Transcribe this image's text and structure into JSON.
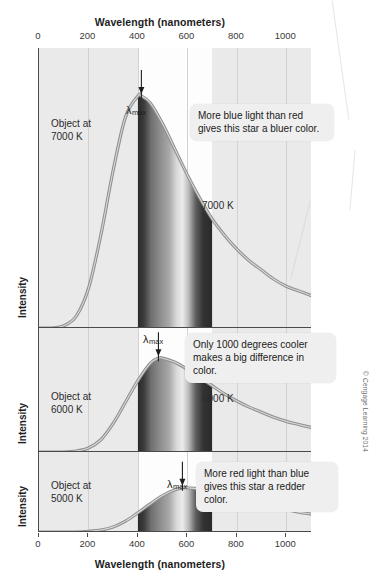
{
  "figure": {
    "top_axis_title": "Wavelength (nanometers)",
    "bottom_axis_title": "Wavelength (nanometers)",
    "y_axis_label": "Intensity",
    "copyright": "© Cengage Learning 2014"
  },
  "ticks": {
    "labels": [
      "0",
      "200",
      "400",
      "600",
      "800",
      "1000"
    ],
    "values": [
      0,
      200,
      400,
      600,
      800,
      1000
    ]
  },
  "bands": [
    {
      "name": "Ultraviolet",
      "start_nm": 0,
      "end_nm": 400
    },
    {
      "name": "Visual",
      "start_nm": 400,
      "end_nm": 700
    },
    {
      "name": "Infrared",
      "start_nm": 700,
      "end_nm": 1100
    }
  ],
  "panels": [
    {
      "object_label": "Object at\n7000 K",
      "temp_label": "7000 K",
      "lmax_label": "λ",
      "lmax_sub": "max",
      "callout": "More blue light than red\ngives this star a bluer color.",
      "peak_nm": 414,
      "temperature_k": 7000
    },
    {
      "object_label": "Object at\n6000 K",
      "temp_label": "6000 K",
      "lmax_label": "λ",
      "lmax_sub": "max",
      "callout": "Only 1000 degrees cooler\nmakes a big difference in color.",
      "peak_nm": 483,
      "temperature_k": 6000
    },
    {
      "object_label": "Object at\n5000 K",
      "temp_label": "5000 K",
      "lmax_label": "λ",
      "lmax_sub": "max",
      "callout": "More red light than blue\ngives this star a redder color.",
      "peak_nm": 580,
      "temperature_k": 5000
    }
  ],
  "chart_data": {
    "type": "line",
    "xlabel": "Wavelength (nanometers)",
    "ylabel": "Intensity",
    "xlim": [
      0,
      1100
    ],
    "xticks": [
      0,
      200,
      400,
      600,
      800,
      1000
    ],
    "grid": true,
    "legend_position": "in-plot",
    "annotations": [
      "Ultraviolet",
      "Visual",
      "Infrared",
      "More blue light than red gives this star a bluer color.",
      "Only 1000 degrees cooler makes a big difference in color.",
      "More red light than blue gives this star a redder color."
    ],
    "series": [
      {
        "name": "7000 K",
        "peak_nm": 414,
        "panel": 1,
        "x": [
          0,
          50,
          100,
          150,
          200,
          250,
          300,
          350,
          400,
          414,
          450,
          500,
          550,
          600,
          650,
          700,
          750,
          800,
          850,
          900,
          950,
          1000,
          1050,
          1100
        ],
        "y": [
          0.0,
          0.0,
          0.01,
          0.05,
          0.17,
          0.4,
          0.68,
          0.91,
          1.0,
          1.0,
          0.97,
          0.88,
          0.77,
          0.66,
          0.56,
          0.47,
          0.4,
          0.34,
          0.29,
          0.25,
          0.21,
          0.18,
          0.16,
          0.14
        ]
      },
      {
        "name": "6000 K",
        "peak_nm": 483,
        "panel": 2,
        "x": [
          0,
          50,
          100,
          150,
          200,
          250,
          300,
          350,
          400,
          450,
          483,
          500,
          550,
          600,
          650,
          700,
          750,
          800,
          850,
          900,
          950,
          1000,
          1050,
          1100
        ],
        "y": [
          0.0,
          0.0,
          0.0,
          0.01,
          0.04,
          0.12,
          0.28,
          0.49,
          0.7,
          0.87,
          0.92,
          0.92,
          0.88,
          0.81,
          0.73,
          0.65,
          0.57,
          0.5,
          0.44,
          0.39,
          0.34,
          0.3,
          0.27,
          0.24
        ]
      },
      {
        "name": "5000 K",
        "peak_nm": 580,
        "panel": 3,
        "x": [
          0,
          50,
          100,
          150,
          200,
          250,
          300,
          350,
          400,
          450,
          500,
          550,
          580,
          600,
          650,
          700,
          750,
          800,
          850,
          900,
          950,
          1000,
          1050,
          1100
        ],
        "y": [
          0.0,
          0.0,
          0.0,
          0.0,
          0.01,
          0.03,
          0.08,
          0.17,
          0.3,
          0.44,
          0.57,
          0.66,
          0.69,
          0.69,
          0.67,
          0.63,
          0.58,
          0.53,
          0.48,
          0.43,
          0.39,
          0.35,
          0.31,
          0.28
        ]
      }
    ]
  }
}
